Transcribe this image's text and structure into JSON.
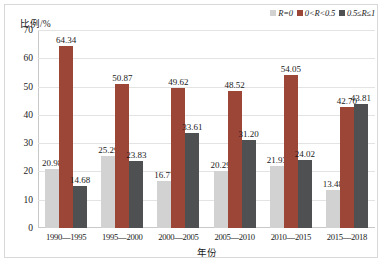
{
  "chart_data": {
    "type": "bar",
    "title": "",
    "xlabel": "年份",
    "ylabel": "比例/%",
    "ylim": [
      0,
      70
    ],
    "yticks": [
      0,
      10,
      20,
      30,
      40,
      50,
      60,
      70
    ],
    "grid": true,
    "legend_position": "top-right",
    "categories": [
      "1990—1995",
      "1995—2000",
      "2000—2005",
      "2005—2010",
      "2010—2015",
      "2015—2018"
    ],
    "series": [
      {
        "name": "R=0",
        "color": "#d2d2d2",
        "values": [
          20.98,
          25.29,
          16.77,
          20.29,
          21.93,
          13.48
        ],
        "labels": [
          "20.98",
          "25.29",
          "16.77",
          "20.29",
          "21.93",
          "13.48"
        ]
      },
      {
        "name": "0<R<0.5",
        "color": "#9c4637",
        "values": [
          64.34,
          50.87,
          49.62,
          48.52,
          54.05,
          42.7
        ],
        "labels": [
          "64.34",
          "50.87",
          "49.62",
          "48.52",
          "54.05",
          "42.70"
        ]
      },
      {
        "name": "0.5≤R≤1",
        "color": "#4f5052",
        "values": [
          14.68,
          23.83,
          33.61,
          31.2,
          24.02,
          43.81
        ],
        "labels": [
          "14.68",
          "23.83",
          "33.61",
          "31.20",
          "24.02",
          "43.81"
        ]
      }
    ]
  },
  "axis": {
    "ytick_labels": [
      "70",
      "60",
      "50",
      "40",
      "30",
      "20",
      "10",
      "0"
    ]
  }
}
